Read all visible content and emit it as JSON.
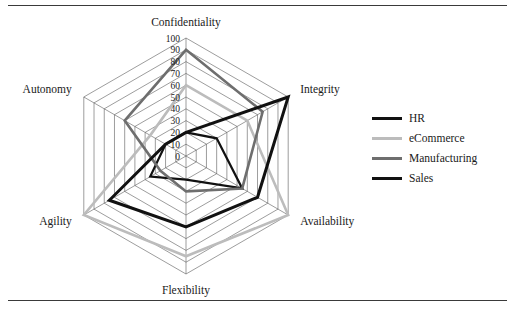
{
  "figure": {
    "has_top_rule": true,
    "has_bottom_rule": true
  },
  "chart_data": {
    "type": "radar",
    "title": "",
    "xlabel": "",
    "ylabel": "",
    "categories": [
      "Confidentiality",
      "Integrity",
      "Availability",
      "Flexibility",
      "Agility",
      "Autonomy"
    ],
    "tick_labels": [
      "0",
      "10",
      "20",
      "30",
      "40",
      "50",
      "60",
      "70",
      "80",
      "90",
      "100"
    ],
    "tick_values": [
      0,
      10,
      20,
      30,
      40,
      50,
      60,
      70,
      80,
      90,
      100
    ],
    "axis_range": [
      0,
      100
    ],
    "grid": true,
    "legend_position": "right",
    "series": [
      {
        "name": "HR",
        "color": "#111111",
        "width": 2.2,
        "values": [
          20,
          30,
          55,
          20,
          35,
          20
        ]
      },
      {
        "name": "eCommerce",
        "color": "#bcbcbc",
        "width": 2.6,
        "values": [
          60,
          60,
          100,
          85,
          100,
          35
        ]
      },
      {
        "name": "Manufacturing",
        "color": "#6e6e6e",
        "width": 2.6,
        "values": [
          90,
          75,
          55,
          30,
          25,
          60
        ]
      },
      {
        "name": "Sales",
        "color": "#111111",
        "width": 3.0,
        "values": [
          20,
          100,
          70,
          60,
          75,
          20
        ]
      }
    ]
  },
  "legend": {
    "items": [
      {
        "label": "HR",
        "color": "#111111",
        "width": 3.0
      },
      {
        "label": "eCommerce",
        "color": "#bcbcbc",
        "width": 3.0
      },
      {
        "label": "Manufacturing",
        "color": "#6e6e6e",
        "width": 3.2
      },
      {
        "label": "Sales",
        "color": "#111111",
        "width": 3.2
      }
    ]
  }
}
